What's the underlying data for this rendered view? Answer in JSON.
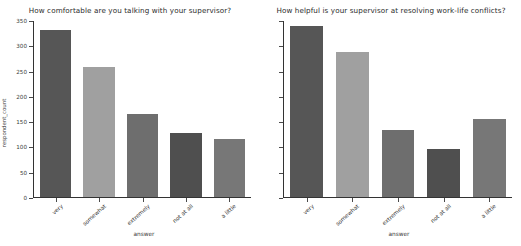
{
  "figure": {
    "background_color": "#ffffff",
    "panel_count": 2
  },
  "chart_data": [
    {
      "type": "bar",
      "title": "How comfortable are you talking with your supervisor?",
      "xlabel": "answer",
      "ylabel": "respondent_count",
      "categories": [
        "very",
        "somewhat",
        "extremely",
        "not at all",
        "a little"
      ],
      "values": [
        333,
        258,
        165,
        128,
        116
      ],
      "bar_colors": [
        "#565656",
        "#a0a0a0",
        "#6e6e6e",
        "#4f4f4f",
        "#777777"
      ],
      "ylim": [
        0,
        350
      ],
      "yticks": [
        0,
        50,
        100,
        150,
        200,
        250,
        300,
        350
      ],
      "ytick_labels": [
        "0",
        "50",
        "100",
        "150",
        "200",
        "250",
        "300",
        "350"
      ],
      "grid": false,
      "legend": "none",
      "xtick_rotation": -42
    },
    {
      "type": "bar",
      "title": "How helpful is your supervisor at resolving work-life conflicts?",
      "xlabel": "answer",
      "ylabel": "",
      "categories": [
        "very",
        "somewhat",
        "extremely",
        "not at all",
        "a little"
      ],
      "values": [
        340,
        288,
        133,
        95,
        155
      ],
      "bar_colors": [
        "#565656",
        "#a0a0a0",
        "#6e6e6e",
        "#4f4f4f",
        "#777777"
      ],
      "ylim": [
        0,
        350
      ],
      "yticks": [
        0,
        50,
        100,
        150,
        200,
        250,
        300,
        350
      ],
      "ytick_labels": [
        "",
        "",
        "",
        "",
        "",
        "",
        "",
        ""
      ],
      "grid": false,
      "legend": "none",
      "xtick_rotation": -42
    }
  ]
}
